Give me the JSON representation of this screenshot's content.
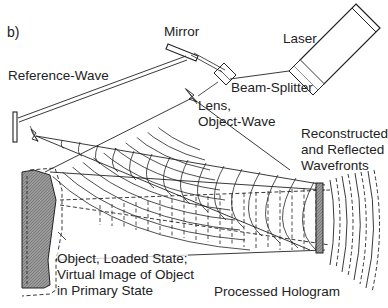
{
  "figure": {
    "panel_label": "b)",
    "labels": {
      "mirror": "Mirror",
      "laser": "Laser",
      "reference_wave": "Reference-Wave",
      "beam_splitter": "Beam-Splitter",
      "lens_line1": "Lens,",
      "lens_line2": "Object-Wave",
      "reconstructed_line1": "Reconstructed",
      "reconstructed_line2": "and Reflected",
      "reconstructed_line3": "Wavefronts",
      "object_line1": "Object, Loaded State;",
      "object_line2": "Virtual Image of Object",
      "object_line3": "in Primary State",
      "processed_hologram": "Processed Hologram"
    },
    "components": [
      "laser",
      "beam-splitter",
      "mirror",
      "lens",
      "reference-lens",
      "object",
      "hologram-plate"
    ],
    "colors": {
      "line": "#222222",
      "object_fill": "#8a8a8a",
      "hologram_fill": "#9a9a9a",
      "background": "#ffffff"
    }
  }
}
